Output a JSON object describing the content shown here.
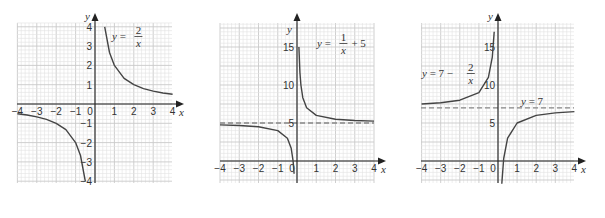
{
  "chart_data": [
    {
      "type": "line",
      "title": "",
      "equation_label": {
        "lhs": "y =",
        "num": "2",
        "den": "x"
      },
      "function": "2/x",
      "xlabel": "x",
      "ylabel": "y",
      "xlim": [
        -4,
        4
      ],
      "ylim": [
        -4,
        4
      ],
      "x_ticks": [
        "-4",
        "-3",
        "-2",
        "-1",
        "0",
        "1",
        "2",
        "3",
        "4"
      ],
      "y_ticks": [
        {
          "value": 4,
          "label": "4"
        },
        {
          "value": 3,
          "label": "3"
        },
        {
          "value": 2,
          "label": "2"
        },
        {
          "value": 1,
          "label": "1"
        },
        {
          "value": -1,
          "label": "-1"
        },
        {
          "value": -2,
          "label": "-2"
        },
        {
          "value": -3,
          "label": "-3"
        },
        {
          "value": -4,
          "label": "-4"
        }
      ],
      "grid": true,
      "asymptote": null,
      "series": [
        {
          "name": "y = 2/x (x>0)",
          "x": [
            0.5,
            0.75,
            1,
            1.5,
            2,
            2.5,
            3,
            3.5,
            4
          ],
          "y": [
            4,
            2.67,
            2,
            1.33,
            1,
            0.8,
            0.67,
            0.57,
            0.5
          ]
        },
        {
          "name": "y = 2/x (x<0)",
          "x": [
            -4,
            -3.5,
            -3,
            -2.5,
            -2,
            -1.5,
            -1,
            -0.75,
            -0.5
          ],
          "y": [
            -0.5,
            -0.57,
            -0.67,
            -0.8,
            -1,
            -1.33,
            -2,
            -2.67,
            -4
          ]
        }
      ]
    },
    {
      "type": "line",
      "title": "",
      "equation_label": {
        "lhs": "y =",
        "num": "1",
        "den": "x",
        "rhs": "+ 5"
      },
      "function": "1/x + 5",
      "xlabel": "x",
      "ylabel": "y",
      "xlim": [
        -4,
        4
      ],
      "ylim": [
        -3,
        18
      ],
      "x_ticks": [
        "-4",
        "-3",
        "-2",
        "-1",
        "0",
        "1",
        "2",
        "3",
        "4"
      ],
      "y_ticks": [
        {
          "value": 15,
          "label": "15"
        },
        {
          "value": 10,
          "label": "10"
        },
        {
          "value": 5,
          "label": "5"
        }
      ],
      "grid": true,
      "asymptote": {
        "y": 5,
        "style": "dashed"
      },
      "series": [
        {
          "name": "y = 1/x + 5 (x>0)",
          "x": [
            0.1,
            0.15,
            0.2,
            0.3,
            0.5,
            1,
            2,
            3,
            4
          ],
          "y": [
            15,
            11.67,
            10,
            8.33,
            7,
            6,
            5.5,
            5.33,
            5.25
          ]
        },
        {
          "name": "y = 1/x + 5 (x<0)",
          "x": [
            -4,
            -3,
            -2,
            -1,
            -0.5,
            -0.3,
            -0.2,
            -0.15
          ],
          "y": [
            4.75,
            4.67,
            4.5,
            4,
            3,
            1.67,
            0,
            -1.67
          ]
        }
      ]
    },
    {
      "type": "line",
      "title": "",
      "equation_label": {
        "lhs": "y = 7 −",
        "num": "2",
        "den": "x"
      },
      "asymptote_label": "y = 7",
      "function": "7 - 2/x",
      "xlabel": "x",
      "ylabel": "y",
      "xlim": [
        -4,
        4
      ],
      "ylim": [
        -3,
        18
      ],
      "x_ticks": [
        "-4",
        "-3",
        "-2",
        "-1",
        "0",
        "1",
        "2",
        "3",
        "4"
      ],
      "y_ticks": [
        {
          "value": 15,
          "label": "15"
        },
        {
          "value": 10,
          "label": "10"
        },
        {
          "value": 5,
          "label": "5"
        }
      ],
      "grid": true,
      "asymptote": {
        "y": 7,
        "style": "dashed"
      },
      "series": [
        {
          "name": "y = 7 - 2/x (x<0)",
          "x": [
            -4,
            -3,
            -2,
            -1,
            -0.5,
            -0.3,
            -0.2
          ],
          "y": [
            7.5,
            7.67,
            8,
            9,
            11,
            13.67,
            17
          ]
        },
        {
          "name": "y = 7 - 2/x (x>0)",
          "x": [
            0.2,
            0.3,
            0.5,
            1,
            2,
            3,
            4
          ],
          "y": [
            -3,
            0.33,
            3,
            5,
            6,
            6.33,
            6.5
          ]
        }
      ]
    }
  ],
  "charts": [
    {
      "eq_y": "y",
      "eq_eq": "=",
      "eq_num": "2",
      "eq_den": "x",
      "eq_rhs": ""
    },
    {
      "eq_y": "y",
      "eq_eq": "=",
      "eq_num": "1",
      "eq_den": "x",
      "eq_rhs": "+ 5"
    },
    {
      "eq_y": "y",
      "eq_eq": "= 7 −",
      "eq_num": "2",
      "eq_den": "x",
      "eq_rhs": "",
      "asym_label": "y = 7"
    }
  ],
  "axis": {
    "x": "x",
    "y": "y"
  }
}
